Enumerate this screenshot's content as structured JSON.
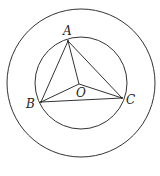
{
  "diagram": {
    "type": "geometry",
    "outer_circle": {
      "cx": 81,
      "cy": 83,
      "r": 74
    },
    "inner_circle": {
      "cx": 81,
      "cy": 83,
      "r": 46
    },
    "points": {
      "A": {
        "x": 68,
        "y": 41,
        "label": "A",
        "label_x": 63,
        "label_y": 35
      },
      "B": {
        "x": 41,
        "y": 102,
        "label": "B",
        "label_x": 26,
        "label_y": 108
      },
      "C": {
        "x": 122,
        "y": 98,
        "label": "C",
        "label_x": 126,
        "label_y": 104
      },
      "O": {
        "x": 79,
        "y": 84,
        "label": "O",
        "label_x": 76,
        "label_y": 97
      }
    },
    "segments": [
      "AB",
      "BC",
      "CA",
      "OA",
      "OB",
      "OC"
    ],
    "stroke_color": "#333333"
  }
}
